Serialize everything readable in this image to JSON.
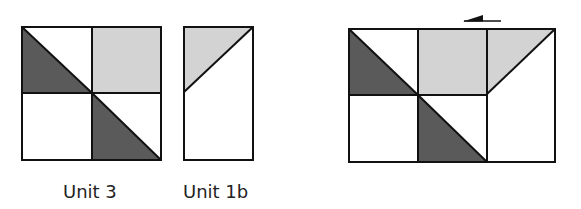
{
  "colors": {
    "background": "#ffffff",
    "stroke": "#111111",
    "dark_fill": "#5a5a5a",
    "light_fill": "#d3d3d3",
    "white_fill": "#ffffff",
    "label_text": "#222222"
  },
  "labels": {
    "unit3": "Unit 3",
    "unit1b": "Unit 1b"
  },
  "diagrams": [
    {
      "id": "unit-3",
      "description": "2x2 square block: top-left half-square triangle (dark lower-left), top-right light square, bottom-left white square, bottom-right half-square triangle (dark lower-left)"
    },
    {
      "id": "unit-1b",
      "description": "Tall rectangle with diagonal from mid-left to top-right; light triangle in upper-left"
    },
    {
      "id": "combined",
      "description": "Unit 3 joined with Unit 1b on the right, with a left-pointing arrow above the seam"
    }
  ],
  "arrow": {
    "direction": "left"
  }
}
